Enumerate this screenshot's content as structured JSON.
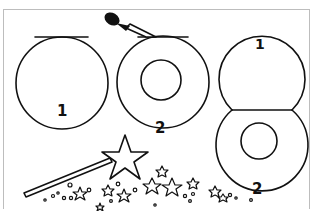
{
  "illustration": {
    "description": "Craft instruction line drawing: circles cut and assembled into a figure-eight, with a match stick and a star wand with sparkles",
    "colors": {
      "line": "#111111",
      "frame": "#bdbdbd",
      "background": "#ffffff"
    },
    "panels": [
      {
        "name": "circle-step-1",
        "label": "1"
      },
      {
        "name": "circle-step-2",
        "label": "2"
      },
      {
        "name": "figure-eight-top",
        "label": "1"
      },
      {
        "name": "figure-eight-bottom",
        "label": "2"
      }
    ]
  }
}
